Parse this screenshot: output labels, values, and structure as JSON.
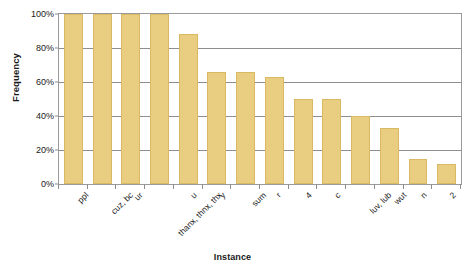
{
  "chart_data": {
    "type": "bar",
    "title": "",
    "xlabel": "Instance",
    "ylabel": "Frequency",
    "categories": [
      "ppl",
      "cuz, bc",
      "ur",
      "thanx, thnx, thx",
      "u",
      "y",
      "sum",
      "r",
      "4",
      "c",
      "luv, lub",
      "wut",
      "n",
      "2"
    ],
    "values": [
      100,
      100,
      100,
      100,
      88,
      66,
      66,
      63,
      50,
      50,
      40,
      33,
      15,
      12
    ],
    "ylim": [
      0,
      100
    ],
    "ytick_labels": [
      "100%",
      "80%",
      "60%",
      "40%",
      "20%",
      "0%"
    ],
    "ytick_values": [
      100,
      80,
      60,
      40,
      20,
      0
    ],
    "grid": true,
    "legend": "none",
    "series_color": "#e9cd80",
    "series_border_color": "#d9b964",
    "axis_color": "#8e8e8e",
    "text_color": "#1a1a1a",
    "background": "#ffffff",
    "value_unit": "%"
  }
}
